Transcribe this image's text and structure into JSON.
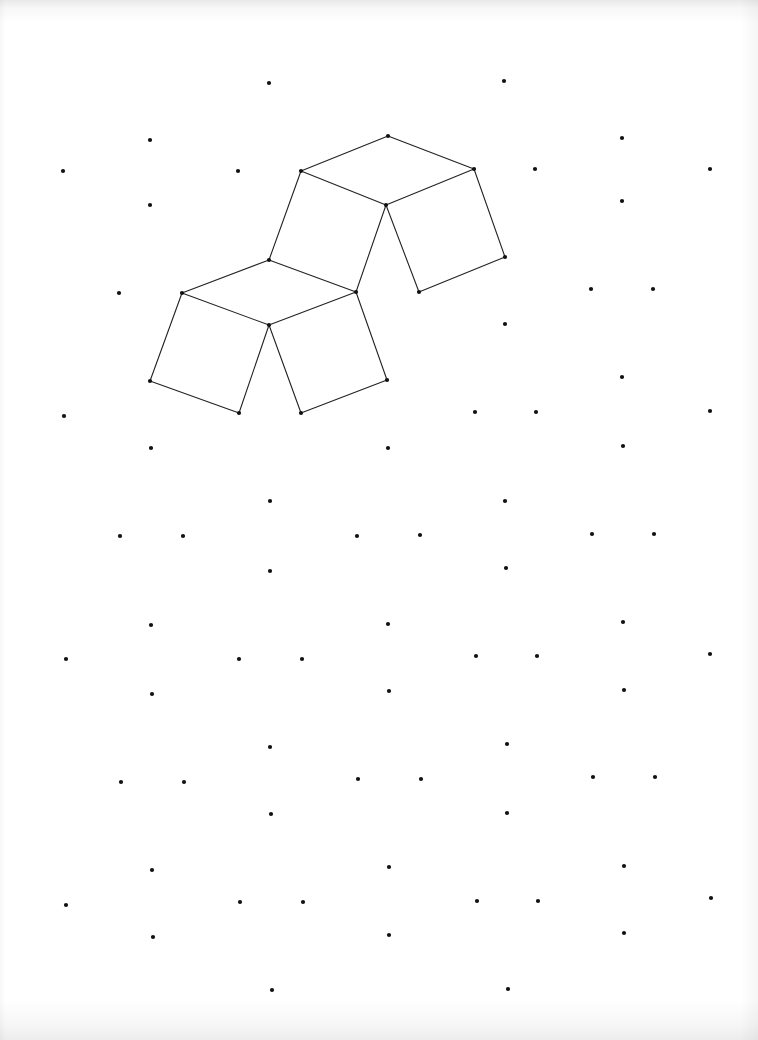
{
  "sheet": {
    "type": "isometric dot paper",
    "dot_color": "#111111",
    "line_color": "#222222",
    "dot_radius": 2.1
  },
  "dots": [
    [
      269,
      83
    ],
    [
      504,
      81
    ],
    [
      150,
      140
    ],
    [
      622,
      138
    ],
    [
      63,
      171
    ],
    [
      238,
      171
    ],
    [
      301,
      171
    ],
    [
      388,
      136
    ],
    [
      474,
      169
    ],
    [
      535,
      169
    ],
    [
      710,
      169
    ],
    [
      150,
      205
    ],
    [
      386,
      205
    ],
    [
      622,
      201
    ],
    [
      269,
      260
    ],
    [
      505,
      257
    ],
    [
      119,
      293
    ],
    [
      182,
      293
    ],
    [
      356,
      292
    ],
    [
      419,
      292
    ],
    [
      591,
      289
    ],
    [
      653,
      289
    ],
    [
      269,
      325
    ],
    [
      505,
      324
    ],
    [
      150,
      381
    ],
    [
      387,
      380
    ],
    [
      622,
      377
    ],
    [
      64,
      416
    ],
    [
      239,
      413
    ],
    [
      301,
      413
    ],
    [
      475,
      412
    ],
    [
      536,
      412
    ],
    [
      710,
      411
    ],
    [
      151,
      448
    ],
    [
      388,
      448
    ],
    [
      623,
      446
    ],
    [
      270,
      501
    ],
    [
      505,
      501
    ],
    [
      120,
      536
    ],
    [
      183,
      536
    ],
    [
      357,
      536
    ],
    [
      420,
      535
    ],
    [
      592,
      534
    ],
    [
      654,
      534
    ],
    [
      270,
      571
    ],
    [
      506,
      568
    ],
    [
      151,
      625
    ],
    [
      388,
      624
    ],
    [
      623,
      622
    ],
    [
      66,
      659
    ],
    [
      239,
      659
    ],
    [
      302,
      659
    ],
    [
      476,
      656
    ],
    [
      537,
      656
    ],
    [
      710,
      654
    ],
    [
      152,
      694
    ],
    [
      389,
      691
    ],
    [
      624,
      690
    ],
    [
      270,
      747
    ],
    [
      507,
      744
    ],
    [
      121,
      782
    ],
    [
      184,
      782
    ],
    [
      358,
      779
    ],
    [
      421,
      779
    ],
    [
      593,
      777
    ],
    [
      655,
      777
    ],
    [
      271,
      814
    ],
    [
      507,
      813
    ],
    [
      152,
      870
    ],
    [
      389,
      867
    ],
    [
      624,
      866
    ],
    [
      66,
      905
    ],
    [
      240,
      902
    ],
    [
      303,
      902
    ],
    [
      477,
      901
    ],
    [
      538,
      901
    ],
    [
      711,
      898
    ],
    [
      153,
      937
    ],
    [
      389,
      935
    ],
    [
      624,
      933
    ],
    [
      272,
      990
    ],
    [
      508,
      989
    ]
  ],
  "figure": {
    "edges": [
      [
        388,
        136,
        301,
        171
      ],
      [
        388,
        136,
        474,
        169
      ],
      [
        301,
        171,
        386,
        205
      ],
      [
        474,
        169,
        386,
        205
      ],
      [
        474,
        169,
        505,
        257
      ],
      [
        505,
        257,
        419,
        292
      ],
      [
        419,
        292,
        386,
        205
      ],
      [
        301,
        171,
        269,
        260
      ],
      [
        386,
        205,
        356,
        292
      ],
      [
        269,
        260,
        356,
        292
      ],
      [
        269,
        260,
        182,
        293
      ],
      [
        182,
        293,
        269,
        325
      ],
      [
        269,
        325,
        356,
        292
      ],
      [
        182,
        293,
        150,
        381
      ],
      [
        150,
        381,
        239,
        413
      ],
      [
        239,
        413,
        269,
        325
      ],
      [
        269,
        325,
        301,
        413
      ],
      [
        301,
        413,
        387,
        380
      ],
      [
        387,
        380,
        356,
        292
      ]
    ]
  }
}
